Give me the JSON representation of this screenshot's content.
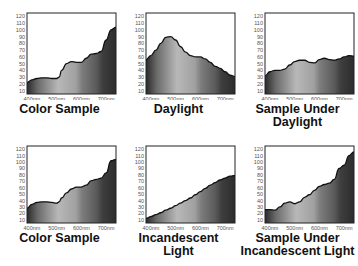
{
  "chart_data": [
    {
      "type": "area",
      "title": "Color Sample",
      "xlabel": "",
      "ylabel": "",
      "ylim": [
        5,
        125
      ],
      "x_ticks": [
        "400nm",
        "500nm",
        "600nm",
        "700nm"
      ],
      "y_ticks": [
        10,
        20,
        30,
        40,
        50,
        60,
        70,
        80,
        90,
        100,
        110,
        120
      ],
      "x": [
        380,
        400,
        420,
        440,
        460,
        480,
        500,
        510,
        520,
        540,
        560,
        580,
        600,
        620,
        640,
        660,
        680,
        700,
        720,
        740
      ],
      "values": [
        22,
        26,
        28,
        29,
        29,
        28,
        28,
        30,
        40,
        50,
        53,
        52,
        52,
        58,
        64,
        65,
        68,
        85,
        100,
        104
      ]
    },
    {
      "type": "area",
      "title": "Daylight",
      "xlabel": "",
      "ylabel": "",
      "ylim": [
        5,
        125
      ],
      "x_ticks": [
        "400nm",
        "500nm",
        "600nm",
        "700nm"
      ],
      "y_ticks": [
        10,
        20,
        30,
        40,
        50,
        60,
        70,
        80,
        90,
        100,
        110,
        120
      ],
      "x": [
        380,
        400,
        420,
        440,
        460,
        480,
        500,
        520,
        540,
        560,
        580,
        600,
        620,
        640,
        660,
        680,
        700,
        720,
        740
      ],
      "values": [
        56,
        62,
        70,
        80,
        89,
        90,
        85,
        75,
        67,
        62,
        60,
        60,
        57,
        52,
        46,
        43,
        38,
        33,
        31
      ]
    },
    {
      "type": "area",
      "title": "Sample Under Daylight",
      "xlabel": "",
      "ylabel": "",
      "ylim": [
        5,
        125
      ],
      "x_ticks": [
        "400nm",
        "500nm",
        "600nm",
        "700nm"
      ],
      "y_ticks": [
        10,
        20,
        30,
        40,
        50,
        60,
        70,
        80,
        90,
        100,
        110,
        120
      ],
      "x": [
        380,
        400,
        420,
        440,
        460,
        480,
        500,
        520,
        540,
        560,
        580,
        600,
        620,
        640,
        660,
        680,
        700,
        720,
        740
      ],
      "values": [
        32,
        38,
        40,
        40,
        42,
        48,
        53,
        55,
        55,
        52,
        51,
        56,
        58,
        56,
        55,
        57,
        60,
        62,
        61
      ]
    },
    {
      "type": "area",
      "title": "Color Sample",
      "xlabel": "",
      "ylabel": "",
      "ylim": [
        5,
        125
      ],
      "x_ticks": [
        "400nm",
        "500nm",
        "600nm",
        "700nm"
      ],
      "y_ticks": [
        10,
        20,
        30,
        40,
        50,
        60,
        70,
        80,
        90,
        100,
        110,
        120
      ],
      "x": [
        380,
        400,
        420,
        440,
        460,
        480,
        500,
        510,
        520,
        540,
        560,
        580,
        600,
        620,
        640,
        660,
        680,
        700,
        720,
        740
      ],
      "values": [
        28,
        34,
        37,
        38,
        38,
        37,
        36,
        38,
        44,
        52,
        58,
        61,
        61,
        64,
        71,
        73,
        75,
        83,
        102,
        104
      ]
    },
    {
      "type": "area",
      "title": "Incandescent Light",
      "xlabel": "",
      "ylabel": "",
      "ylim": [
        5,
        125
      ],
      "x_ticks": [
        "400nm",
        "500nm",
        "600nm",
        "700nm"
      ],
      "y_ticks": [
        10,
        20,
        30,
        40,
        50,
        60,
        70,
        80,
        90,
        100,
        110,
        120
      ],
      "x": [
        380,
        400,
        420,
        440,
        460,
        480,
        500,
        520,
        540,
        560,
        580,
        600,
        620,
        640,
        660,
        680,
        700,
        720,
        740
      ],
      "values": [
        12,
        15,
        18,
        21,
        25,
        28,
        32,
        36,
        40,
        44,
        49,
        54,
        59,
        64,
        68,
        72,
        75,
        78,
        79
      ]
    },
    {
      "type": "area",
      "title": "Sample Under Incandescent Light",
      "xlabel": "",
      "ylabel": "",
      "ylim": [
        5,
        125
      ],
      "x_ticks": [
        "400nm",
        "500nm",
        "600nm",
        "700nm"
      ],
      "y_ticks": [
        10,
        20,
        30,
        40,
        50,
        60,
        70,
        80,
        90,
        100,
        110,
        120
      ],
      "x": [
        380,
        400,
        420,
        440,
        460,
        480,
        500,
        520,
        540,
        560,
        580,
        600,
        620,
        640,
        660,
        680,
        700,
        720,
        740
      ],
      "values": [
        26,
        26,
        25,
        30,
        36,
        38,
        35,
        38,
        45,
        49,
        56,
        62,
        65,
        67,
        73,
        90,
        95,
        110,
        116
      ]
    }
  ],
  "panels": [
    {
      "title_lines": [
        "Color Sample"
      ]
    },
    {
      "title_lines": [
        "Daylight"
      ]
    },
    {
      "title_lines": [
        "Sample Under",
        "Daylight"
      ]
    },
    {
      "title_lines": [
        "Color Sample"
      ]
    },
    {
      "title_lines": [
        "Incandescent",
        "Light"
      ]
    },
    {
      "title_lines": [
        "Sample Under",
        "Incandescent Light"
      ]
    }
  ]
}
